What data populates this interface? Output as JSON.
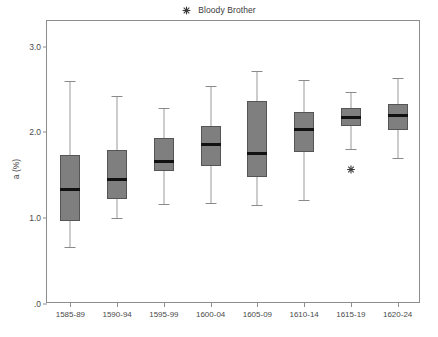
{
  "legend": {
    "marker_icon": "asterisk-marker-icon",
    "label": "Bloody Brother"
  },
  "axes": {
    "ylabel": "a (%)",
    "yticks": [
      "3.0",
      "2.0",
      "1.0",
      ".0"
    ],
    "ytick_values": [
      3.0,
      2.0,
      1.0,
      0.0
    ],
    "ylim": [
      0.0,
      3.3
    ],
    "xlabel": ""
  },
  "style": {
    "box_fill": "#807f7f",
    "box_border": "#555555",
    "median_color": "#111111",
    "whisker_color": "#9a9a9a",
    "frame_color": "#8d8d8d",
    "text_color": "#4a4a4a",
    "background": "#ffffff"
  },
  "chart_data": {
    "type": "box",
    "title": "",
    "xlabel": "",
    "ylabel": "a (%)",
    "ylim": [
      0.0,
      3.3
    ],
    "grid": false,
    "legend_position": "top-center",
    "legend_entries": [
      "Bloody Brother"
    ],
    "categories": [
      "1585-89",
      "1590-94",
      "1595-99",
      "1600-04",
      "1605-09",
      "1610-14",
      "1615-19",
      "1620-24"
    ],
    "boxes": [
      {
        "category": "1585-89",
        "whisker_low": 0.66,
        "q1": 0.97,
        "median": 1.34,
        "q3": 1.74,
        "whisker_high": 2.6,
        "outliers": []
      },
      {
        "category": "1590-94",
        "whisker_low": 1.0,
        "q1": 1.23,
        "median": 1.45,
        "q3": 1.8,
        "whisker_high": 2.42,
        "outliers": []
      },
      {
        "category": "1595-99",
        "whisker_low": 1.17,
        "q1": 1.55,
        "median": 1.66,
        "q3": 1.93,
        "whisker_high": 2.28,
        "outliers": []
      },
      {
        "category": "1600-04",
        "whisker_low": 1.18,
        "q1": 1.61,
        "median": 1.86,
        "q3": 2.07,
        "whisker_high": 2.54,
        "outliers": []
      },
      {
        "category": "1605-09",
        "whisker_low": 1.16,
        "q1": 1.48,
        "median": 1.76,
        "q3": 2.37,
        "whisker_high": 2.72,
        "outliers": []
      },
      {
        "category": "1610-14",
        "whisker_low": 1.21,
        "q1": 1.77,
        "median": 2.03,
        "q3": 2.24,
        "whisker_high": 2.61,
        "outliers": []
      },
      {
        "category": "1615-19",
        "whisker_low": 1.81,
        "q1": 2.08,
        "median": 2.17,
        "q3": 2.28,
        "whisker_high": 2.47,
        "outliers": [
          1.58
        ]
      },
      {
        "category": "1620-24",
        "whisker_low": 1.7,
        "q1": 2.03,
        "median": 2.2,
        "q3": 2.33,
        "whisker_high": 2.63,
        "outliers": []
      }
    ]
  }
}
